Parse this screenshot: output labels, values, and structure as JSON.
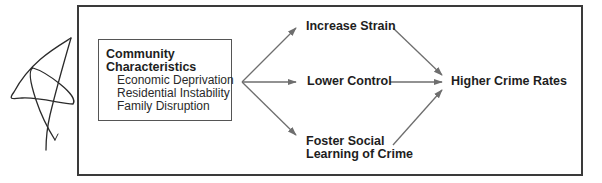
{
  "diagram": {
    "source": {
      "title_lines": [
        "Community",
        "Characteristics"
      ],
      "items": [
        "Economic Deprivation",
        "Residential Instability",
        "Family Disruption"
      ]
    },
    "mediators": [
      {
        "id": "strain",
        "lines": [
          "Increase Strain"
        ]
      },
      {
        "id": "control",
        "lines": [
          "Lower Control"
        ]
      },
      {
        "id": "social",
        "lines": [
          "Foster Social",
          "Learning of Crime"
        ]
      }
    ],
    "outcome": {
      "label": "Higher Crime Rates"
    },
    "edges": [
      {
        "from": "source",
        "to": "strain"
      },
      {
        "from": "source",
        "to": "control"
      },
      {
        "from": "source",
        "to": "social"
      },
      {
        "from": "strain",
        "to": "outcome"
      },
      {
        "from": "control",
        "to": "outcome"
      },
      {
        "from": "social",
        "to": "outcome"
      }
    ],
    "colors": {
      "frame": "#3a3a3a",
      "arrow": "#6e6e6e",
      "text": "#1e1e1e",
      "scribble": "#2b2b2b"
    }
  }
}
